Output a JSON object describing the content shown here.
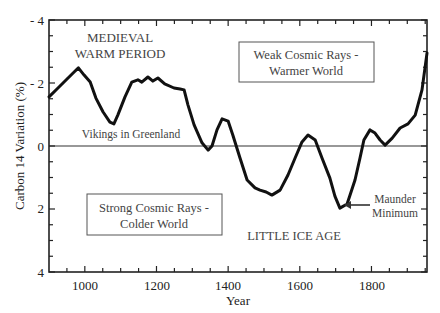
{
  "chart_data": {
    "type": "line",
    "title": "",
    "xlabel": "Year",
    "ylabel": "Carbon 14 Variation (%)",
    "xlim": [
      900,
      1955
    ],
    "ylim": [
      -4,
      4
    ],
    "y_inverted": true,
    "grid": false,
    "x_ticks": [
      1000,
      1200,
      1400,
      1600,
      1800
    ],
    "y_ticks": [
      -4,
      -2,
      0,
      2,
      4
    ],
    "y_tick_labels": [
      "- 4",
      "- 2",
      "0",
      "2",
      "4"
    ],
    "series": [
      {
        "name": "Carbon 14 Variation",
        "x": [
          900,
          925,
          970,
          982,
          998,
          1015,
          1031,
          1051,
          1070,
          1081,
          1092,
          1112,
          1131,
          1148,
          1159,
          1176,
          1190,
          1204,
          1223,
          1249,
          1266,
          1277,
          1288,
          1305,
          1327,
          1344,
          1355,
          1369,
          1383,
          1400,
          1413,
          1433,
          1453,
          1475,
          1489,
          1506,
          1522,
          1545,
          1567,
          1587,
          1606,
          1623,
          1643,
          1662,
          1684,
          1698,
          1712,
          1732,
          1754,
          1768,
          1779,
          1796,
          1810,
          1824,
          1838,
          1858,
          1880,
          1902,
          1922,
          1941,
          1955
        ],
        "values": [
          -1.56,
          -1.84,
          -2.35,
          -2.48,
          -2.25,
          -2.03,
          -1.52,
          -1.08,
          -0.76,
          -0.7,
          -0.98,
          -1.56,
          -2.03,
          -2.1,
          -2.03,
          -2.19,
          -2.06,
          -2.16,
          -1.97,
          -1.84,
          -1.81,
          -1.78,
          -1.3,
          -0.67,
          -0.1,
          0.13,
          0.0,
          -0.51,
          -0.86,
          -0.79,
          -0.35,
          0.38,
          1.08,
          1.33,
          1.4,
          1.46,
          1.56,
          1.4,
          0.92,
          0.38,
          -0.13,
          -0.35,
          -0.19,
          0.38,
          1.02,
          1.59,
          1.97,
          1.84,
          1.08,
          0.38,
          -0.19,
          -0.51,
          -0.41,
          -0.19,
          -0.03,
          -0.25,
          -0.57,
          -0.7,
          -0.98,
          -1.78,
          -2.95
        ]
      }
    ],
    "annotations": [
      {
        "text": "MEDIEVAL",
        "x": 1000,
        "y": -3.6
      },
      {
        "text": "WARM PERIOD",
        "x": 1000,
        "y": -3.1
      },
      {
        "text": "Vikings in Greenland",
        "x": 1150,
        "y": -0.4
      },
      {
        "text": "Weak Cosmic Rays -",
        "x": 1590,
        "y": -3.0,
        "boxed": true
      },
      {
        "text": "Warmer World",
        "x": 1590,
        "y": -2.5,
        "boxed": true
      },
      {
        "text": "Strong Cosmic Rays -",
        "x": 1130,
        "y": 1.7,
        "boxed": true
      },
      {
        "text": "Colder World",
        "x": 1130,
        "y": 2.2,
        "boxed": true
      },
      {
        "text": "LITTLE ICE AGE",
        "x": 1560,
        "y": 2.6
      },
      {
        "text": "Maunder",
        "x": 1870,
        "y": 1.5
      },
      {
        "text": "Minimum",
        "x": 1870,
        "y": 1.95
      },
      {
        "text": "arrow to Maunder Minimum",
        "x": 1710,
        "y": 1.95
      }
    ]
  },
  "labels": {
    "y_axis_title": "Carbon 14 Variation (%)",
    "x_axis_title": "Year",
    "y_ticks": [
      "- 4",
      "- 2",
      "0",
      "2",
      "4"
    ],
    "x_ticks": [
      "1000",
      "1200",
      "1400",
      "1600",
      "1800"
    ],
    "medieval_line1": "MEDIEVAL",
    "medieval_line2": "WARM PERIOD",
    "vikings": "Vikings in Greenland",
    "weak_line1": "Weak Cosmic Rays -",
    "weak_line2": "Warmer World",
    "strong_line1": "Strong Cosmic Rays -",
    "strong_line2": "Colder World",
    "little_ice_age": "LITTLE ICE AGE",
    "maunder_line1": "Maunder",
    "maunder_line2": "Minimum"
  },
  "colors": {
    "line": "#111111",
    "axis": "#222222",
    "annotation_text": "#444444",
    "background": "#ffffff"
  }
}
